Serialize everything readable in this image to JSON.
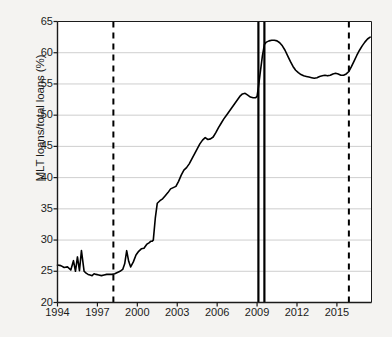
{
  "chart_data": {
    "type": "line",
    "title": "",
    "xlabel": "",
    "ylabel": "MLT loans/total loans (%)",
    "xlim": [
      1994,
      2017.6
    ],
    "ylim": [
      20,
      65
    ],
    "grid": true,
    "legend": "none",
    "y_ticks": [
      20,
      25,
      30,
      35,
      40,
      45,
      50,
      55,
      60,
      65
    ],
    "x_ticks": [
      1994,
      1997,
      2000,
      2003,
      2006,
      2009,
      2012,
      2015
    ],
    "y_tick_labels": [
      "20",
      "25",
      "30",
      "35",
      "40",
      "45",
      "50",
      "55",
      "60",
      "65"
    ],
    "x_tick_labels": [
      "1994",
      "1997",
      "2000",
      "2003",
      "2006",
      "2009",
      "2012",
      "2015"
    ],
    "line_color": "#000000",
    "grid_color": "#c8c8c8",
    "axis_color": "#1b1b1b",
    "plot_background": "#ffffff",
    "figure_background": "#f4f3f1",
    "vertical_lines": [
      {
        "x": 1998.2,
        "style": "dashed",
        "color": "#000000"
      },
      {
        "x": 2009.1,
        "style": "solid",
        "color": "#000000"
      },
      {
        "x": 2009.55,
        "style": "solid",
        "color": "#000000"
      },
      {
        "x": 2015.9,
        "style": "dashed",
        "color": "#000000"
      }
    ],
    "series": [
      {
        "name": "MLT loans/total loans",
        "x": [
          1994.0,
          1994.25,
          1994.5,
          1994.75,
          1995.0,
          1995.2,
          1995.35,
          1995.5,
          1995.65,
          1995.8,
          1996.0,
          1996.15,
          1996.3,
          1996.45,
          1996.6,
          1996.75,
          1996.9,
          1997.1,
          1997.3,
          1997.5,
          1997.7,
          1997.9,
          1998.1,
          1998.3,
          1998.5,
          1998.7,
          1998.9,
          1999.05,
          1999.2,
          1999.35,
          1999.5,
          1999.7,
          1999.9,
          2000.1,
          2000.3,
          2000.5,
          2000.7,
          2000.9,
          2001.0,
          2001.1,
          2001.2,
          2001.35,
          2001.5,
          2001.7,
          2001.9,
          2002.1,
          2002.3,
          2002.5,
          2002.7,
          2002.9,
          2003.1,
          2003.3,
          2003.5,
          2003.7,
          2003.9,
          2004.1,
          2004.3,
          2004.5,
          2004.7,
          2004.9,
          2005.1,
          2005.3,
          2005.5,
          2005.7,
          2005.9,
          2006.1,
          2006.3,
          2006.5,
          2006.7,
          2006.9,
          2007.1,
          2007.3,
          2007.5,
          2007.7,
          2007.9,
          2008.1,
          2008.3,
          2008.5,
          2008.7,
          2008.9,
          2009.0,
          2009.1,
          2009.25,
          2009.4,
          2009.55,
          2009.7,
          2009.9,
          2010.1,
          2010.3,
          2010.5,
          2010.7,
          2010.9,
          2011.1,
          2011.3,
          2011.5,
          2011.7,
          2011.9,
          2012.1,
          2012.3,
          2012.5,
          2012.7,
          2012.9,
          2013.1,
          2013.3,
          2013.5,
          2013.7,
          2013.9,
          2014.1,
          2014.3,
          2014.5,
          2014.7,
          2014.9,
          2015.1,
          2015.3,
          2015.5,
          2015.7,
          2015.9,
          2016.1,
          2016.3,
          2016.5,
          2016.7,
          2016.9,
          2017.1,
          2017.3,
          2017.5
        ],
        "y": [
          26.0,
          25.9,
          25.6,
          25.7,
          25.2,
          26.7,
          25.0,
          27.3,
          25.1,
          28.3,
          25.0,
          24.7,
          24.5,
          24.4,
          24.3,
          24.6,
          24.5,
          24.4,
          24.3,
          24.4,
          24.5,
          24.5,
          24.5,
          24.6,
          24.8,
          25.0,
          25.3,
          26.2,
          28.3,
          26.6,
          25.7,
          26.5,
          27.6,
          28.2,
          28.6,
          28.7,
          29.3,
          29.6,
          29.8,
          29.8,
          30.0,
          33.5,
          35.9,
          36.3,
          36.6,
          37.1,
          37.6,
          38.2,
          38.4,
          38.6,
          39.4,
          40.4,
          41.2,
          41.6,
          42.2,
          43.0,
          43.8,
          44.6,
          45.4,
          46.0,
          46.4,
          46.1,
          46.2,
          46.5,
          47.2,
          48.0,
          48.7,
          49.4,
          50.0,
          50.6,
          51.2,
          51.8,
          52.4,
          53.0,
          53.4,
          53.5,
          53.2,
          52.9,
          52.8,
          52.8,
          53.0,
          54.5,
          57.0,
          59.5,
          61.3,
          61.7,
          61.9,
          62.0,
          62.0,
          61.9,
          61.6,
          61.1,
          60.4,
          59.5,
          58.6,
          57.8,
          57.2,
          56.8,
          56.5,
          56.3,
          56.2,
          56.1,
          56.0,
          55.9,
          56.0,
          56.2,
          56.3,
          56.4,
          56.3,
          56.4,
          56.6,
          56.7,
          56.6,
          56.4,
          56.4,
          56.6,
          57.0,
          57.8,
          58.7,
          59.6,
          60.4,
          61.1,
          61.7,
          62.2,
          62.5
        ]
      }
    ]
  },
  "axes": {
    "y_axis_title": "MLT loans/total loans (%)"
  }
}
